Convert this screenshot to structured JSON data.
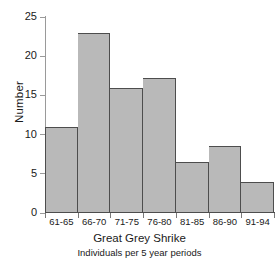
{
  "chart_data": {
    "type": "bar",
    "title": "Great Grey Shrike",
    "subtitle": "Individuals per 5 year periods",
    "xlabel": "",
    "ylabel": "Number",
    "categories": [
      "61-65",
      "66-70",
      "71-75",
      "76-80",
      "81-85",
      "86-90",
      "91-94"
    ],
    "values": [
      11,
      23,
      16,
      17.2,
      6.5,
      8.6,
      4
    ],
    "ylim": [
      0,
      25
    ],
    "yticks": [
      0,
      5,
      10,
      15,
      20,
      25
    ],
    "ytick_labels": [
      "0",
      "5",
      "10",
      "15",
      "20",
      "25"
    ],
    "grid": false,
    "legend": false,
    "series": [
      {
        "name": "Great Grey Shrike",
        "values": [
          11,
          23,
          16,
          17.2,
          6.5,
          8.6,
          4
        ]
      }
    ],
    "colors": {
      "bar_fill": "#b9b9b9",
      "bar_edge": "#4d4d4d",
      "axis": "#9a9a9a",
      "text": "#1a1a1a",
      "background": "#ffffff"
    }
  }
}
